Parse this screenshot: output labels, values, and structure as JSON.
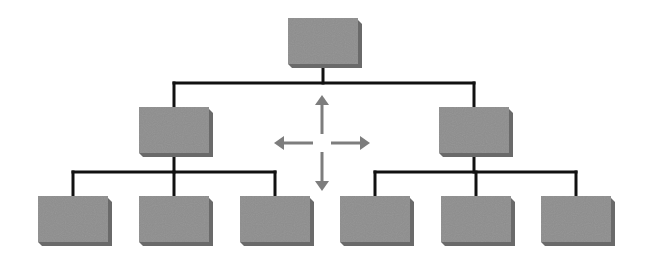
{
  "diagram": {
    "type": "hierarchy",
    "colors": {
      "box_face": "#8e8e8e",
      "box_edge": "#6a6a6a",
      "connector": "#111111",
      "arrow": "#7d7d7d",
      "background": "#ffffff"
    },
    "nodes": [
      {
        "id": "root",
        "level": 0,
        "label": ""
      },
      {
        "id": "mid-left",
        "level": 1,
        "parent": "root",
        "label": ""
      },
      {
        "id": "mid-right",
        "level": 1,
        "parent": "root",
        "label": ""
      },
      {
        "id": "leaf-1",
        "level": 2,
        "parent": "mid-left",
        "label": ""
      },
      {
        "id": "leaf-2",
        "level": 2,
        "parent": "mid-left",
        "label": ""
      },
      {
        "id": "leaf-3",
        "level": 2,
        "parent": "mid-left",
        "label": ""
      },
      {
        "id": "leaf-4",
        "level": 2,
        "parent": "mid-right",
        "label": ""
      },
      {
        "id": "leaf-5",
        "level": 2,
        "parent": "mid-right",
        "label": ""
      },
      {
        "id": "leaf-6",
        "level": 2,
        "parent": "mid-right",
        "label": ""
      }
    ],
    "arrow_symbol": {
      "name": "four-way-move",
      "directions": [
        "up",
        "down",
        "left",
        "right"
      ]
    }
  }
}
